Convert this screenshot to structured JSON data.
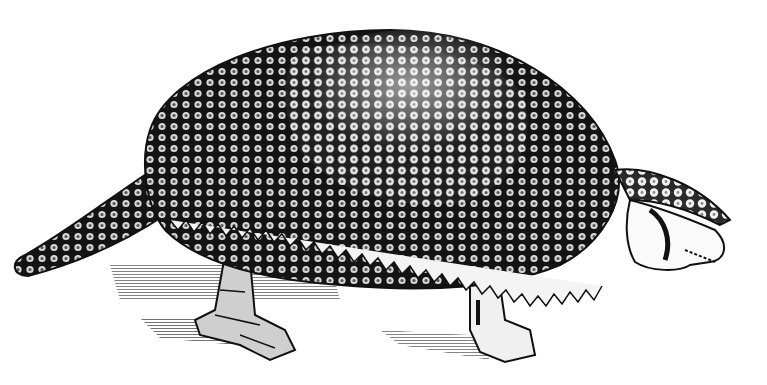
{
  "image": {
    "subject": "glyptodon engraving",
    "style": "black-and-white woodcut illustration",
    "colors": {
      "ink": "#111111",
      "paper": "#ffffff",
      "scute": "#e8e8e8"
    }
  }
}
